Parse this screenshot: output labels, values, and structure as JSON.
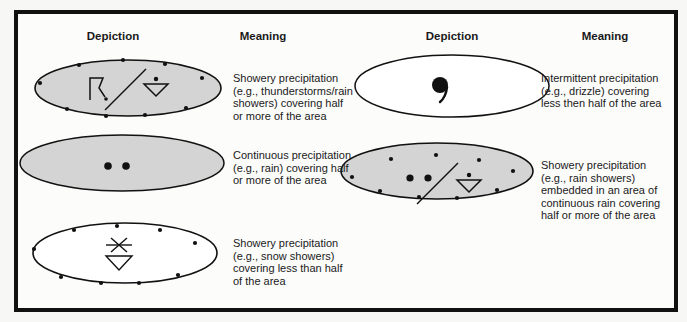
{
  "headers": {
    "left_depiction": "Depiction",
    "left_meaning": "Meaning",
    "right_depiction": "Depiction",
    "right_meaning": "Meaning"
  },
  "legend": [
    {
      "id": "thunderstorm-showers",
      "symbols": [
        "thunderstorm-icon",
        "slash",
        "rain-shower-icon"
      ],
      "fill": "#d4d4d4",
      "boundary": "dotted",
      "meaning": "Showery precipitation\n(e.g., thunderstorms/rain\nshowers) covering half\nor more of the area"
    },
    {
      "id": "drizzle",
      "symbols": [
        "drizzle-icon"
      ],
      "fill": "#ffffff",
      "boundary": "solid",
      "meaning": "Intermittent precipitation\n(e.g., drizzle) covering\nless then half of the area"
    },
    {
      "id": "continuous-rain",
      "symbols": [
        "rain-dots-icon"
      ],
      "fill": "#d4d4d4",
      "boundary": "solid",
      "meaning": "Continuous precipitation\n(e.g., rain) covering half\nor more of the area"
    },
    {
      "id": "rain-showers-embedded",
      "symbols": [
        "rain-dots-icon",
        "slash",
        "rain-shower-icon"
      ],
      "fill": "#d4d4d4",
      "boundary": "dotted",
      "meaning": "Showery precipitation\n(e.g., rain showers)\nembedded in an area of\ncontinuous rain covering\nhalf or more of the area"
    },
    {
      "id": "snow-showers",
      "symbols": [
        "snow-shower-icon"
      ],
      "fill": "#ffffff",
      "boundary": "dotted",
      "meaning": "Showery precipitation\n(e.g.,  snow showers)\ncovering less than half\nof the area"
    }
  ],
  "colors": {
    "border": "#111111",
    "shaded_fill": "#d4d4d4",
    "unshaded_fill": "#ffffff",
    "ink": "#1a1a1a"
  }
}
